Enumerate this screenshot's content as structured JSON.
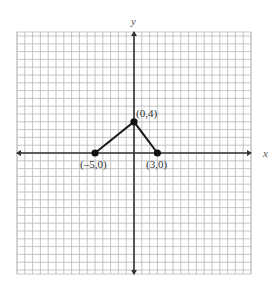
{
  "chart_data": {
    "type": "line",
    "title": "",
    "xlabel": "x",
    "ylabel": "y",
    "grid": true,
    "xlim": [
      -15,
      15
    ],
    "ylim": [
      -15,
      15
    ],
    "series": [
      {
        "name": "piecewise",
        "points": [
          {
            "x": -5,
            "y": 0,
            "label": "(–5,0)"
          },
          {
            "x": 0,
            "y": 4,
            "label": "(0,4)"
          },
          {
            "x": 3,
            "y": 0,
            "label": "(3,0)"
          }
        ]
      }
    ],
    "colors": {
      "grid": "#b8b8b8",
      "axis": "#333333",
      "line": "#1a1a1a",
      "point": "#111111"
    }
  },
  "labels": {
    "x_axis": "x",
    "y_axis": "y",
    "point_a": "(–5,0)",
    "point_b": "(0,4)",
    "point_c": "(3,0)"
  }
}
